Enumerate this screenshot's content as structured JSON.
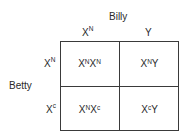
{
  "father": {
    "name": "Billy",
    "alleles": [
      {
        "base": "X",
        "sup": "N"
      },
      {
        "base": "Y",
        "sup": ""
      }
    ]
  },
  "mother": {
    "name": "Betty",
    "alleles": [
      {
        "base": "X",
        "sup": "N"
      },
      {
        "base": "X",
        "sup": "c"
      }
    ]
  },
  "cells": [
    [
      [
        {
          "base": "X",
          "sup": "N"
        },
        {
          "base": "X",
          "sup": "N"
        }
      ],
      [
        {
          "base": "X",
          "sup": "N"
        },
        {
          "base": "Y",
          "sup": ""
        }
      ]
    ],
    [
      [
        {
          "base": "X",
          "sup": "N"
        },
        {
          "base": "X",
          "sup": "c"
        }
      ],
      [
        {
          "base": "X",
          "sup": "c"
        },
        {
          "base": "Y",
          "sup": ""
        }
      ]
    ]
  ],
  "colors": {
    "line": "#3a3a3a",
    "text": "#2a2a2a",
    "background": "#ffffff"
  }
}
